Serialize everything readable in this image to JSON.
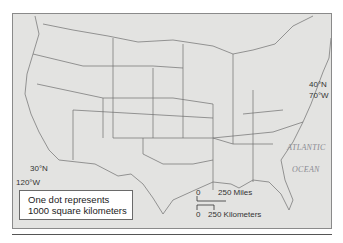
{
  "map": {
    "subject": "Contiguous United States",
    "coordinates": [
      {
        "label": "40°N",
        "position": "northeast"
      },
      {
        "label": "70°W",
        "position": "northeast"
      },
      {
        "label": "30°N",
        "position": "southwest"
      },
      {
        "label": "120°W",
        "position": "southwest"
      }
    ],
    "ocean_labels": [
      "ATLANTIC",
      "OCEAN"
    ],
    "legend": {
      "line1": "One dot represents",
      "line2": "1000 square kilometers"
    },
    "scale_bars": {
      "miles": {
        "zero": "0",
        "value": "250 Miles"
      },
      "kilometers": {
        "zero": "0",
        "value": "250 Kilometers"
      }
    },
    "colors": {
      "land": "#e3e3e1",
      "borders": "#6e6e6e",
      "frame": "#8a8a8a"
    }
  }
}
